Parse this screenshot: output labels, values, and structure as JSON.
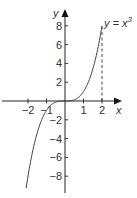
{
  "chart_data": {
    "type": "line",
    "title": "",
    "xlabel": "x",
    "ylabel": "y",
    "annotation": "y = x³",
    "function": "x^3",
    "series": [
      {
        "name": "y = x^3",
        "x": [
          -2.1,
          -2,
          -1.5,
          -1,
          -0.5,
          0,
          0.5,
          1,
          1.5,
          2
        ],
        "y": [
          -9.26,
          -8,
          -3.375,
          -1,
          -0.125,
          0,
          0.125,
          1,
          3.375,
          8
        ]
      }
    ],
    "x_ticks": [
      -2,
      -1,
      1,
      2
    ],
    "x_tick_labels": [
      "−2",
      "−1",
      "1",
      "2"
    ],
    "y_ticks": [
      8,
      6,
      4,
      2,
      -2,
      -4,
      -6,
      -8
    ],
    "y_tick_labels": [
      "8",
      "6",
      "4",
      "2",
      "−2",
      "−4",
      "−6",
      "−8"
    ],
    "xlim": [
      -3.5,
      3.7
    ],
    "ylim": [
      -9.8,
      9.5
    ],
    "dashed_guide": {
      "x": 2,
      "from_y": 0,
      "to_y": 8
    },
    "grid": false,
    "legend": "none"
  },
  "labels": {
    "x_axis": "x",
    "y_axis": "y",
    "curve": "y = x",
    "curve_exp": "3"
  },
  "colors": {
    "axis": "#222222",
    "curve": "#444444",
    "text": "#333333"
  }
}
